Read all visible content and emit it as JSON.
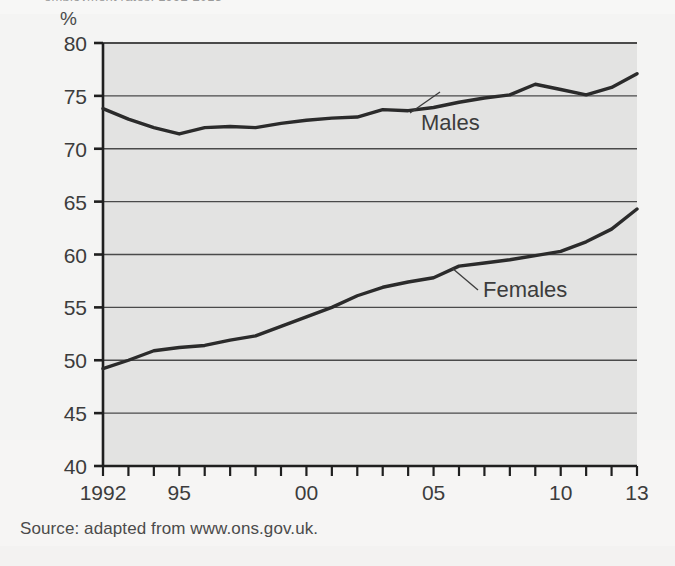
{
  "page": {
    "clipped_caption": "employment rates, 1992-2013",
    "source_note": "Source: adapted from www.ons.gov.uk.",
    "unit_label": "%"
  },
  "colors": {
    "page_background": "#f4f4f3",
    "plot_background": "#e3e3e2",
    "line": "#2b2b2b",
    "gridline": "#4a4a4a",
    "axis": "#1f1f1f",
    "text": "#3c3c3c"
  },
  "chart_data": {
    "type": "line",
    "title": "",
    "subtitle": "",
    "xlabel": "",
    "ylabel": "%",
    "xlim": [
      1992,
      2013
    ],
    "ylim": [
      40,
      80
    ],
    "yticks": [
      40,
      45,
      50,
      55,
      60,
      65,
      70,
      75,
      80
    ],
    "ytick_labels": [
      "40",
      "45",
      "50",
      "55",
      "60",
      "65",
      "70",
      "75",
      "80"
    ],
    "xticks": [
      1992,
      1993,
      1994,
      1995,
      1996,
      1997,
      1998,
      1999,
      2000,
      2001,
      2002,
      2003,
      2004,
      2005,
      2006,
      2007,
      2008,
      2009,
      2010,
      2011,
      2012,
      2013
    ],
    "xtick_labels": [
      {
        "x": 1992,
        "label": "1992"
      },
      {
        "x": 1995,
        "label": "95"
      },
      {
        "x": 2000,
        "label": "00"
      },
      {
        "x": 2005,
        "label": "05"
      },
      {
        "x": 2010,
        "label": "10"
      },
      {
        "x": 2013,
        "label": "13"
      }
    ],
    "grid": true,
    "grid_axis": "y",
    "legend": "inline-annotations",
    "x": [
      1992,
      1993,
      1994,
      1995,
      1996,
      1997,
      1998,
      1999,
      2000,
      2001,
      2002,
      2003,
      2004,
      2005,
      2006,
      2007,
      2008,
      2009,
      2010,
      2011,
      2012,
      2013
    ],
    "series": [
      {
        "name": "Males",
        "label": "Males",
        "values": [
          73.8,
          72.8,
          72.0,
          71.4,
          72.0,
          72.1,
          72.0,
          72.4,
          72.7,
          72.9,
          73.0,
          73.7,
          73.6,
          73.9,
          74.4,
          74.8,
          75.1,
          76.1,
          75.6,
          75.1,
          75.8,
          77.1
        ]
      },
      {
        "name": "Females",
        "label": "Females",
        "values": [
          49.2,
          50.0,
          50.9,
          51.2,
          51.4,
          51.9,
          52.3,
          53.2,
          54.1,
          55.0,
          56.1,
          56.9,
          57.4,
          57.8,
          58.9,
          59.2,
          59.5,
          59.9,
          60.3,
          61.2,
          62.4,
          64.3
        ]
      }
    ],
    "annotations": [
      {
        "text": "Males",
        "series": "Males",
        "text_x": 421,
        "text_y": 130,
        "leader_from_x": 410,
        "leader_from_y": 113,
        "leader_to_x": 440,
        "leader_to_y": 92
      },
      {
        "text": "Females",
        "series": "Females",
        "text_x": 483,
        "text_y": 297,
        "leader_from_x": 478,
        "leader_from_y": 290,
        "leader_to_x": 452,
        "leader_to_y": 268
      }
    ]
  }
}
